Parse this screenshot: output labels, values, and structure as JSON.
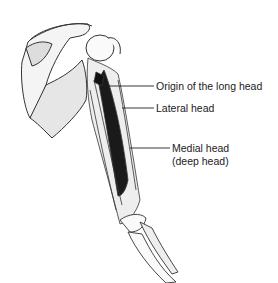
{
  "figure": {
    "labels": [
      {
        "id": "origin-long-head",
        "text": "Origin of the long head"
      },
      {
        "id": "lateral-head",
        "text": "Lateral head"
      },
      {
        "id": "medial-head",
        "line1": "Medial head",
        "line2": "(deep head)"
      }
    ]
  }
}
